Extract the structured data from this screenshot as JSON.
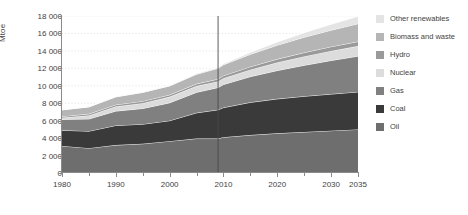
{
  "chart_data": {
    "type": "area",
    "stacked": true,
    "title": "",
    "subtitle": "",
    "xlabel": "",
    "ylabel": "Mtoe",
    "xlim": [
      1980,
      2035
    ],
    "ylim": [
      0,
      18000
    ],
    "grid": true,
    "legend_position": "right",
    "x_tick_labels": [
      "1980",
      "1990",
      "2000",
      "2010",
      "2020",
      "2030",
      "2035"
    ],
    "x_ticks": [
      1980,
      1990,
      2000,
      2010,
      2020,
      2030,
      2035
    ],
    "x_minor_ticks": [
      1985,
      1995,
      2005,
      2015,
      2025
    ],
    "y_tick_labels": [
      "0",
      "2 000",
      "4 000",
      "6 000",
      "8 000",
      "10 000",
      "12 000",
      "14 000",
      "16 000",
      "18 000"
    ],
    "y_ticks": [
      0,
      2000,
      4000,
      6000,
      8000,
      10000,
      12000,
      14000,
      16000,
      18000
    ],
    "x": [
      1980,
      1985,
      1990,
      1995,
      2000,
      2005,
      2009,
      2010,
      2015,
      2020,
      2025,
      2030,
      2035
    ],
    "divider_x": 2009,
    "series": [
      {
        "name": "Oil",
        "color": "#6e6e6e",
        "values": [
          3100,
          2850,
          3200,
          3350,
          3650,
          3950,
          3950,
          4100,
          4350,
          4550,
          4700,
          4850,
          5000
        ]
      },
      {
        "name": "Coal",
        "color": "#3a3a3a",
        "values": [
          1800,
          1950,
          2250,
          2250,
          2350,
          2950,
          3300,
          3400,
          3750,
          3950,
          4100,
          4200,
          4300
        ]
      },
      {
        "name": "Gas",
        "color": "#808080",
        "values": [
          1250,
          1400,
          1650,
          1800,
          2050,
          2350,
          2550,
          2650,
          2950,
          3250,
          3550,
          3850,
          4100
        ]
      },
      {
        "name": "Nuclear",
        "color": "#dcdcdc",
        "values": [
          190,
          400,
          530,
          610,
          680,
          720,
          700,
          720,
          800,
          920,
          1020,
          1100,
          1150
        ]
      },
      {
        "name": "Hydro",
        "color": "#9a9a9a",
        "values": [
          150,
          180,
          200,
          230,
          230,
          250,
          280,
          290,
          340,
          390,
          440,
          480,
          520
        ]
      },
      {
        "name": "Biomass and waste",
        "color": "#b5b5b5",
        "values": [
          750,
          800,
          900,
          1000,
          1020,
          1100,
          1230,
          1250,
          1420,
          1600,
          1760,
          1900,
          2050
        ]
      },
      {
        "name": "Other renewables",
        "color": "#e4e4e4",
        "values": [
          10,
          20,
          30,
          45,
          60,
          90,
          110,
          120,
          230,
          370,
          520,
          680,
          850
        ]
      }
    ],
    "legend_entries": [
      {
        "label": "Other renewables",
        "color": "#e4e4e4"
      },
      {
        "label": "Biomass and waste",
        "color": "#b5b5b5"
      },
      {
        "label": "Hydro",
        "color": "#9a9a9a"
      },
      {
        "label": "Nuclear",
        "color": "#dcdcdc"
      },
      {
        "label": "Gas",
        "color": "#808080"
      },
      {
        "label": "Coal",
        "color": "#3a3a3a"
      },
      {
        "label": "Oil",
        "color": "#6e6e6e"
      }
    ],
    "colors": {
      "grid": "#d9d9d9",
      "axis": "#8a8a8a",
      "divider": "#4a4a4a",
      "separator": "#ffffff",
      "background": "#ffffff",
      "text": "#3f3f3f"
    }
  }
}
